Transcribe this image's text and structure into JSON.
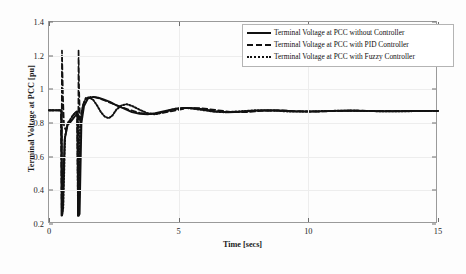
{
  "chart_data": {
    "type": "line",
    "title": "",
    "xlabel": "Time [secs]",
    "ylabel": "Terminal Voltage at PCC [pu]",
    "xlim": [
      0,
      15
    ],
    "ylim": [
      0.2,
      1.4
    ],
    "xticks": [
      0,
      5,
      10,
      15
    ],
    "xtick_labels": [
      "0",
      "5",
      "10",
      "15"
    ],
    "yticks": [
      0.2,
      0.4,
      0.6,
      0.8,
      1,
      1.2,
      1.4
    ],
    "ytick_labels": [
      "0.2",
      "0.4",
      "0.6",
      "0.8",
      "1",
      "1.2",
      "1.4"
    ],
    "grid": true,
    "legend_position": "top-right",
    "series": [
      {
        "name": "Terminal Voltage at PCC without Controller",
        "style": "solid",
        "color": "#111111",
        "x": [
          0,
          0.2,
          0.4,
          0.48,
          0.5,
          0.52,
          0.6,
          0.72,
          0.8,
          0.9,
          1.0,
          1.1,
          1.12,
          1.15,
          1.18,
          1.25,
          1.35,
          1.5,
          1.7,
          1.9,
          2.1,
          2.35,
          2.6,
          2.9,
          3.2,
          3.5,
          3.8,
          4.1,
          4.4,
          4.8,
          5.2,
          5.6,
          6.0,
          6.4,
          6.9,
          7.4,
          7.9,
          8.4,
          8.9,
          9.4,
          9.9,
          10.5,
          11.0,
          11.6,
          12.2,
          12.8,
          13.4,
          14.0,
          14.6,
          15.0
        ],
        "y": [
          0.875,
          0.875,
          0.875,
          0.875,
          0.25,
          0.27,
          0.7,
          0.79,
          0.8,
          0.82,
          0.84,
          0.86,
          0.25,
          0.25,
          0.26,
          0.8,
          0.9,
          0.945,
          0.955,
          0.95,
          0.94,
          0.925,
          0.905,
          0.885,
          0.865,
          0.855,
          0.852,
          0.858,
          0.868,
          0.882,
          0.89,
          0.888,
          0.88,
          0.87,
          0.864,
          0.866,
          0.872,
          0.876,
          0.874,
          0.87,
          0.868,
          0.869,
          0.872,
          0.874,
          0.872,
          0.87,
          0.87,
          0.871,
          0.872,
          0.872
        ]
      },
      {
        "name": "Terminal Voltage at PCC with PID Controller",
        "style": "dashed",
        "color": "#111111",
        "x": [
          0,
          0.2,
          0.4,
          0.46,
          0.48,
          0.5,
          0.54,
          0.58,
          0.64,
          0.72,
          0.8,
          0.9,
          1.0,
          1.08,
          1.12,
          1.14,
          1.16,
          1.2,
          1.26,
          1.34,
          1.45,
          1.6,
          1.8,
          2.0,
          2.2,
          2.5,
          2.8,
          3.1,
          3.5,
          3.9,
          4.3,
          4.8,
          5.3,
          5.8,
          6.4,
          7.0,
          7.6,
          8.2,
          8.9,
          9.6,
          10.3,
          11.0,
          11.8,
          12.6,
          13.4,
          14.2,
          15.0
        ],
        "y": [
          0.875,
          0.875,
          0.875,
          0.875,
          0.25,
          1.23,
          0.95,
          0.78,
          0.76,
          0.79,
          0.81,
          0.84,
          0.86,
          0.87,
          0.25,
          1.235,
          1.0,
          0.8,
          0.86,
          0.92,
          0.945,
          0.955,
          0.952,
          0.942,
          0.93,
          0.912,
          0.895,
          0.878,
          0.86,
          0.853,
          0.858,
          0.872,
          0.888,
          0.889,
          0.878,
          0.866,
          0.864,
          0.872,
          0.876,
          0.87,
          0.867,
          0.871,
          0.874,
          0.871,
          0.87,
          0.871,
          0.872
        ]
      },
      {
        "name": "Terminal Voltage at PCC with Fuzzy Controller",
        "style": "dotted",
        "color": "#111111",
        "x": [
          0,
          0.2,
          0.4,
          0.48,
          0.5,
          0.55,
          0.62,
          0.72,
          0.82,
          0.92,
          1.02,
          1.1,
          1.12,
          1.15,
          1.2,
          1.3,
          1.42,
          1.55,
          1.7,
          1.85,
          2.0,
          2.15,
          2.3,
          2.45,
          2.6,
          2.8,
          3.0,
          3.25,
          3.5,
          3.8,
          4.1,
          4.5,
          4.9,
          5.3,
          5.8,
          6.3,
          6.8,
          7.4,
          8.0,
          8.6,
          9.2,
          9.9,
          10.6,
          11.3,
          12.0,
          12.8,
          13.6,
          14.3,
          15.0
        ],
        "y": [
          0.875,
          0.875,
          0.875,
          0.875,
          0.25,
          0.3,
          0.72,
          0.8,
          0.82,
          0.845,
          0.862,
          0.872,
          0.25,
          0.26,
          0.79,
          0.9,
          0.948,
          0.952,
          0.938,
          0.905,
          0.865,
          0.838,
          0.828,
          0.845,
          0.88,
          0.905,
          0.912,
          0.898,
          0.878,
          0.858,
          0.852,
          0.868,
          0.886,
          0.89,
          0.88,
          0.868,
          0.864,
          0.87,
          0.876,
          0.874,
          0.869,
          0.868,
          0.871,
          0.873,
          0.872,
          0.87,
          0.87,
          0.871,
          0.872
        ]
      }
    ]
  },
  "legend": {
    "items": [
      {
        "label": "Terminal Voltage at PCC without Controller",
        "style": "solid"
      },
      {
        "label": "Terminal Voltage at PCC with PID Controller",
        "style": "dashed"
      },
      {
        "label": "Terminal Voltage at PCC with Fuzzy Controller",
        "style": "dotted"
      }
    ]
  }
}
